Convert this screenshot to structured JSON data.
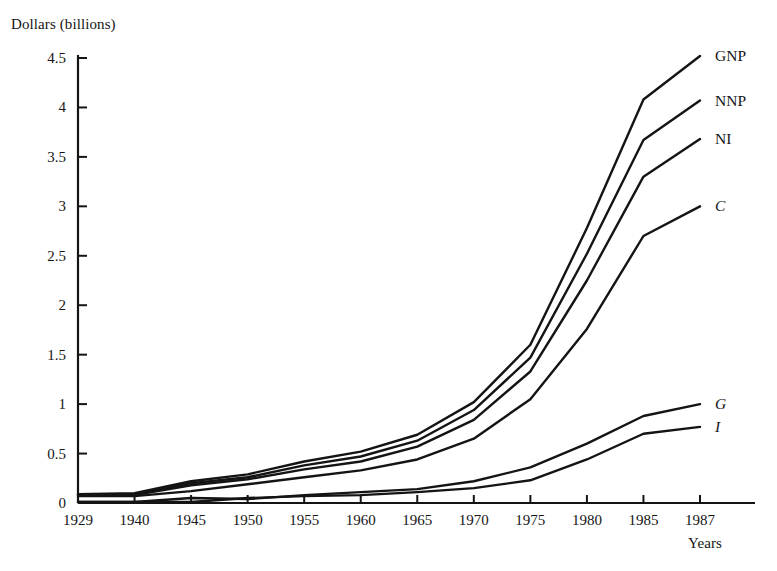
{
  "chart_data": {
    "type": "line",
    "title": "",
    "ylabel": "Dollars (billions)",
    "xlabel": "Years",
    "categories": [
      "1929",
      "1940",
      "1945",
      "1950",
      "1955",
      "1960",
      "1965",
      "1970",
      "1975",
      "1980",
      "1985",
      "1987"
    ],
    "ylim": [
      0,
      4.5
    ],
    "ytick_labels": [
      "0",
      "0.5",
      "1",
      "1.5",
      "2",
      "2.5",
      "3",
      "3.5",
      "4",
      "4.5"
    ],
    "ytick_values": [
      0,
      0.5,
      1,
      1.5,
      2,
      2.5,
      3,
      3.5,
      4,
      4.5
    ],
    "grid": false,
    "legend_position": "right-inline-end-of-line",
    "series": [
      {
        "name": "GNP",
        "italic": false,
        "values": [
          0.09,
          0.1,
          0.22,
          0.29,
          0.42,
          0.52,
          0.69,
          1.02,
          1.6,
          2.78,
          4.08,
          4.52
        ]
      },
      {
        "name": "NNP",
        "italic": false,
        "values": [
          0.08,
          0.09,
          0.2,
          0.26,
          0.38,
          0.47,
          0.63,
          0.94,
          1.47,
          2.52,
          3.67,
          4.07
        ]
      },
      {
        "name": "NI",
        "italic": false,
        "values": [
          0.08,
          0.08,
          0.18,
          0.24,
          0.34,
          0.42,
          0.57,
          0.84,
          1.33,
          2.25,
          3.3,
          3.68
        ]
      },
      {
        "name": "C",
        "italic": true,
        "values": [
          0.07,
          0.07,
          0.12,
          0.19,
          0.26,
          0.33,
          0.44,
          0.65,
          1.05,
          1.76,
          2.7,
          3.0
        ]
      },
      {
        "name": "G",
        "italic": true,
        "values": [
          0.01,
          0.01,
          0.05,
          0.04,
          0.08,
          0.11,
          0.14,
          0.22,
          0.36,
          0.6,
          0.88,
          1.0
        ]
      },
      {
        "name": "I",
        "italic": true,
        "values": [
          0.01,
          0.01,
          0.01,
          0.05,
          0.07,
          0.08,
          0.11,
          0.15,
          0.23,
          0.44,
          0.7,
          0.77
        ]
      }
    ]
  },
  "style": {
    "line_color": "#141414",
    "axis_color": "#141414",
    "background": "#ffffff"
  }
}
